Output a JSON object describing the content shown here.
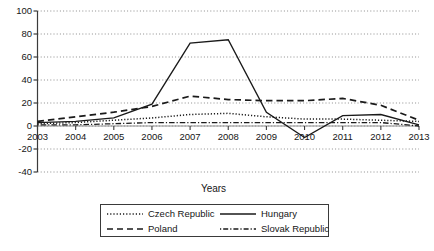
{
  "chart_data": {
    "type": "line",
    "title": "",
    "xlabel": "Years",
    "ylabel": "",
    "x": [
      2003,
      2004,
      2005,
      2006,
      2007,
      2008,
      2009,
      2010,
      2011,
      2012,
      2013
    ],
    "xticklabels": [
      "2003",
      "2004",
      "2005",
      "2006",
      "2007",
      "2008",
      "2009",
      "2010",
      "2011",
      "2012",
      "2013"
    ],
    "yticklabels": [
      "100",
      "80",
      "60",
      "40",
      "20",
      "0",
      "-20",
      "-40"
    ],
    "yticks": [
      100,
      80,
      60,
      40,
      20,
      0,
      -20,
      -40
    ],
    "ylim": [
      -40,
      100
    ],
    "xlim": [
      2003,
      2013
    ],
    "grid": "horizontal-dotted",
    "legend_position": "below-center",
    "series": [
      {
        "name": "Czech Republic",
        "style": "dotted",
        "values": [
          2,
          3,
          5,
          7,
          10,
          11,
          8,
          6,
          6,
          5,
          4
        ]
      },
      {
        "name": "Hungary",
        "style": "solid",
        "values": [
          3,
          4,
          7,
          19,
          72,
          75,
          12,
          -10,
          9,
          10,
          1
        ]
      },
      {
        "name": "Poland",
        "style": "dashed",
        "values": [
          4,
          8,
          12,
          17,
          26,
          23,
          22,
          22,
          24,
          18,
          5
        ]
      },
      {
        "name": "Slovak Republic",
        "style": "dash-dot",
        "values": [
          1,
          1,
          2,
          3,
          3,
          3,
          3,
          3,
          3,
          3,
          0
        ]
      }
    ]
  },
  "legend": {
    "items": [
      {
        "label": "Czech Republic",
        "style": "dotted"
      },
      {
        "label": "Hungary",
        "style": "solid"
      },
      {
        "label": "Poland",
        "style": "dashed"
      },
      {
        "label": "Slovak Republic",
        "style": "dash-dot"
      }
    ]
  }
}
